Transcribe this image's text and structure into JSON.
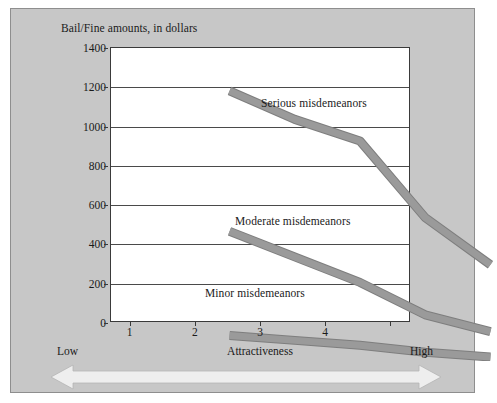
{
  "figure": {
    "background_color": "#c7c7c7",
    "plot_background_color": "#ffffff",
    "line_color": "#9a9a9a"
  },
  "axis_titles": {
    "y": "Bail/Fine amounts, in dollars",
    "x": "Attractiveness"
  },
  "direction": {
    "low": "Low",
    "high": "High"
  },
  "chart_data": {
    "type": "line",
    "title": "",
    "xlabel": "Attractiveness",
    "ylabel": "Bail/Fine amounts, in dollars",
    "x": [
      1,
      2,
      3,
      4,
      5
    ],
    "categories": [
      "1",
      "2",
      "3",
      "4",
      "5"
    ],
    "xtick_labels": [
      "1",
      "2",
      "3",
      "4",
      ""
    ],
    "ytick_labels": [
      "0",
      "200",
      "400",
      "600",
      "800",
      "1000",
      "1200",
      "1400"
    ],
    "yticks": [
      0,
      200,
      400,
      600,
      800,
      1000,
      1200,
      1400
    ],
    "ylim": [
      0,
      1400
    ],
    "xlim": [
      0.7,
      5.3
    ],
    "grid": "horizontal",
    "legend": "inline-labels",
    "series": [
      {
        "name": "Serious misdemeanors",
        "values": [
          1375,
          1230,
          1120,
          730,
          490
        ]
      },
      {
        "name": "Moderate misdemeanors",
        "values": [
          660,
          530,
          400,
          235,
          150
        ]
      },
      {
        "name": "Minor misdemeanors",
        "values": [
          130,
          105,
          80,
          45,
          20
        ]
      }
    ],
    "annotations": [
      {
        "text": "Serious misdemeanors",
        "x": 3.5,
        "y": 1150
      },
      {
        "text": "Moderate misdemeanors",
        "x": 3.15,
        "y": 560
      },
      {
        "text": "Minor misdemeanors",
        "x": 2.75,
        "y": 190
      }
    ]
  }
}
